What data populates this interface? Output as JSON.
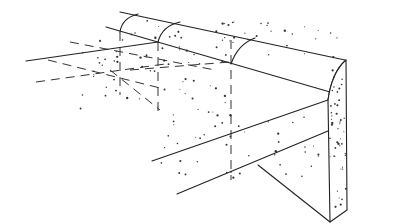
{
  "diagram": {
    "title": "",
    "parts": [
      {
        "name": "curb-top-rounded",
        "label": ""
      },
      {
        "name": "curb-end-face",
        "label": ""
      },
      {
        "name": "base-slab",
        "label": ""
      },
      {
        "name": "hidden-lines",
        "label": ""
      }
    ],
    "colors": {
      "ink": "#222222",
      "paper": "#ffffff"
    }
  }
}
